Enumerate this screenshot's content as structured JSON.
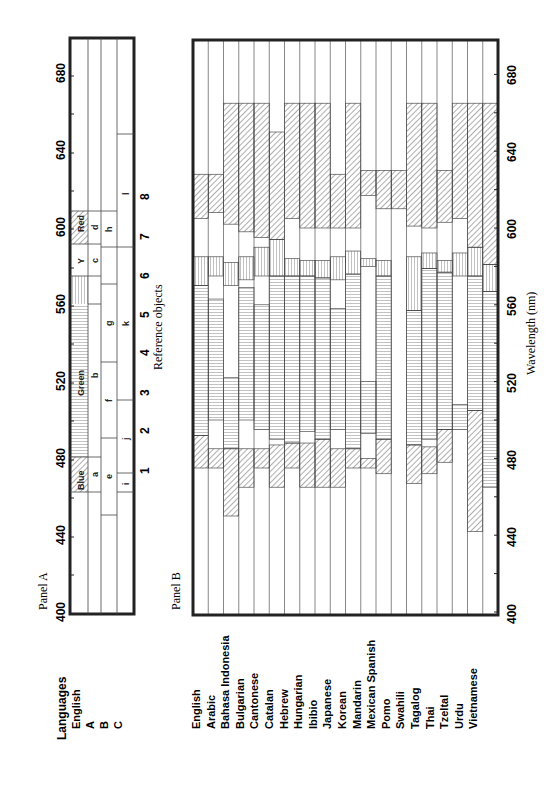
{
  "chart_data": [
    {
      "type": "bar",
      "orientation": "rotated-90",
      "title": "Panel A",
      "xlabel": "Reference objects",
      "ylabel": "Wavelength (nm)",
      "axis_ticks": [
        "400",
        "440",
        "480",
        "520",
        "560",
        "600",
        "640",
        "680"
      ],
      "ylim": [
        400,
        695
      ],
      "rows_label": "Languages",
      "rows": [
        {
          "name": "English",
          "segments": [
            {
              "from": 472,
              "to": 490,
              "label": "Blue",
              "pattern": "diag"
            },
            {
              "from": 490,
              "to": 570,
              "label": "Green",
              "pattern": "vert"
            },
            {
              "from": 570,
              "to": 585,
              "label": "Y",
              "pattern": "horiz"
            },
            {
              "from": 605,
              "to": 630,
              "label": "Red",
              "pattern": "diag"
            }
          ]
        },
        {
          "name": "A",
          "segments": [
            {
              "from": 472,
              "to": 490,
              "label": "a"
            },
            {
              "from": 490,
              "to": 570,
              "label": "b"
            },
            {
              "from": 570,
              "to": 590,
              "label": "c"
            },
            {
              "from": 605,
              "to": 630,
              "label": "d"
            }
          ]
        },
        {
          "name": "B",
          "segments": [
            {
              "from": 460,
              "to": 500,
              "label": "e"
            },
            {
              "from": 500,
              "to": 540,
              "label": "f"
            },
            {
              "from": 540,
              "to": 580,
              "label": "g"
            },
            {
              "from": 598,
              "to": 630,
              "label": "h"
            }
          ]
        },
        {
          "name": "C",
          "segments": [
            {
              "from": 472,
              "to": 482,
              "label": "i"
            },
            {
              "from": 482,
              "to": 520,
              "label": "j"
            },
            {
              "from": 520,
              "to": 600,
              "label": "k"
            },
            {
              "from": 600,
              "to": 650,
              "label": "l"
            }
          ]
        }
      ],
      "reference_objects": [
        {
          "id": "1",
          "wavelength": 474
        },
        {
          "id": "2",
          "wavelength": 496
        },
        {
          "id": "3",
          "wavelength": 516
        },
        {
          "id": "4",
          "wavelength": 538
        },
        {
          "id": "5",
          "wavelength": 559
        },
        {
          "id": "6",
          "wavelength": 580
        },
        {
          "id": "7",
          "wavelength": 601
        },
        {
          "id": "8",
          "wavelength": 622
        }
      ]
    },
    {
      "type": "bar",
      "orientation": "rotated-90",
      "title": "Panel B",
      "ylabel": "Wavelength (nm)",
      "axis_ticks": [
        "400",
        "440",
        "480",
        "520",
        "560",
        "600",
        "640",
        "680"
      ],
      "ylim": [
        400,
        695
      ],
      "languages": [
        {
          "name": "English",
          "blue": [
            475,
            492
          ],
          "green": [
            492,
            570
          ],
          "yellow": [
            570,
            585
          ],
          "red": [
            605,
            628
          ]
        },
        {
          "name": "Arabic",
          "blue": [
            475,
            485
          ],
          "green": [
            500,
            563
          ],
          "yellow": [
            575,
            585
          ],
          "red": [
            608,
            628
          ]
        },
        {
          "name": "Bahasa Indonesia",
          "blue": [
            450,
            485
          ],
          "green": [
            485,
            522
          ],
          "yellow": [
            570,
            582
          ],
          "red": [
            602,
            665
          ]
        },
        {
          "name": "Bulgarian",
          "blue": [
            465,
            485
          ],
          "green": [
            500,
            569
          ],
          "yellow": [
            573,
            585
          ],
          "red": [
            598,
            665
          ]
        },
        {
          "name": "Cantonese",
          "blue": [
            475,
            485
          ],
          "green": [
            495,
            560
          ],
          "yellow": [
            575,
            590
          ],
          "red": [
            595,
            665
          ]
        },
        {
          "name": "Catalan",
          "blue": [
            465,
            487
          ],
          "green": [
            490,
            575
          ],
          "yellow": [
            575,
            594
          ],
          "red": [
            594,
            650
          ]
        },
        {
          "name": "Hebrew",
          "blue": [
            475,
            488
          ],
          "green": [
            488,
            575
          ],
          "yellow": [
            575,
            584
          ],
          "red": [
            605,
            665
          ]
        },
        {
          "name": "Hungarian",
          "blue": [
            465,
            488
          ],
          "green": [
            494,
            575
          ],
          "yellow": [
            575,
            583
          ],
          "red": [
            600,
            665
          ]
        },
        {
          "name": "Ibibio",
          "blue": [
            465,
            490
          ],
          "green": [
            490,
            574
          ],
          "yellow": [
            574,
            583
          ],
          "red": [
            600,
            665
          ]
        },
        {
          "name": "Japanese",
          "blue": [
            465,
            485
          ],
          "green": [
            495,
            558
          ],
          "yellow": [
            573,
            585
          ],
          "red": [
            600,
            628
          ]
        },
        {
          "name": "Korean",
          "blue": [
            475,
            485
          ],
          "green": [
            485,
            576
          ],
          "yellow": [
            576,
            588
          ],
          "red": [
            600,
            665
          ]
        },
        {
          "name": "Mandarin",
          "blue": [
            475,
            480
          ],
          "green": [
            493,
            520
          ],
          "yellow": [
            580,
            584
          ],
          "red": [
            617,
            630
          ]
        },
        {
          "name": "Mexican Spanish",
          "blue": [
            472,
            490
          ],
          "green": [
            490,
            575
          ],
          "yellow": [
            575,
            583
          ],
          "red": [
            610,
            630
          ]
        },
        {
          "name": "Pomo",
          "blue": null,
          "green": null,
          "yellow": null,
          "red": [
            610,
            630
          ]
        },
        {
          "name": "Swahili",
          "blue": [
            467,
            487
          ],
          "green": [
            487,
            557
          ],
          "yellow": [
            557,
            585
          ],
          "red": [
            601,
            665
          ]
        },
        {
          "name": "Tagalog",
          "blue": [
            472,
            486
          ],
          "green": [
            490,
            579
          ],
          "yellow": [
            579,
            587
          ],
          "red": [
            600,
            665
          ]
        },
        {
          "name": "Thai",
          "blue": [
            478,
            495
          ],
          "green": [
            495,
            577
          ],
          "yellow": [
            577,
            583
          ],
          "red": [
            603,
            630
          ]
        },
        {
          "name": "Tzeltal",
          "blue": null,
          "green": [
            495,
            508
          ],
          "yellow": [
            575,
            587
          ],
          "red": [
            605,
            665
          ]
        },
        {
          "name": "Urdu",
          "blue": [
            442,
            505
          ],
          "green": [
            505,
            575
          ],
          "yellow": [
            575,
            590
          ],
          "red": [
            590,
            665
          ]
        },
        {
          "name": "Vietnamese",
          "blue": null,
          "green": [
            465,
            567
          ],
          "yellow": [
            567,
            581
          ],
          "red": [
            581,
            665
          ]
        }
      ]
    }
  ],
  "panelA": {
    "title": "Panel A",
    "rows_header": "Languages",
    "rows": [
      "English",
      "A",
      "B",
      "C"
    ],
    "axis_label": "Reference objects",
    "ticks": [
      "400",
      "440",
      "480",
      "520",
      "560",
      "600",
      "640",
      "680"
    ],
    "ref_numbers": [
      "1",
      "2",
      "3",
      "4",
      "5",
      "6",
      "7",
      "8"
    ],
    "cell_labels": {
      "blue": "Blue",
      "green": "Green",
      "y": "Y",
      "red": "Red",
      "a": "a",
      "b": "b",
      "c": "c",
      "d": "d",
      "e": "e",
      "f": "f",
      "g": "g",
      "h": "h",
      "i": "i",
      "j": "j",
      "k": "k",
      "l": "l"
    }
  },
  "panelB": {
    "title": "Panel B",
    "axis_label": "Wavelength (nm)",
    "ticks": [
      "400",
      "440",
      "480",
      "520",
      "560",
      "600",
      "640",
      "680"
    ],
    "languages": [
      "English",
      "Arabic",
      "Bahasa Indonesia",
      "Bulgarian",
      "Cantonese",
      "Catalan",
      "Hebrew",
      "Hungarian",
      "Ibibio",
      "Japanese",
      "Korean",
      "Mandarin",
      "Mexican Spanish",
      "Pomo",
      "Swahili",
      "Tagalog",
      "Thai",
      "Tzeltal",
      "Urdu",
      "Vietnamese"
    ]
  },
  "colors": {
    "ink": "#222222",
    "grid": "#555555",
    "background": "#ffffff"
  }
}
